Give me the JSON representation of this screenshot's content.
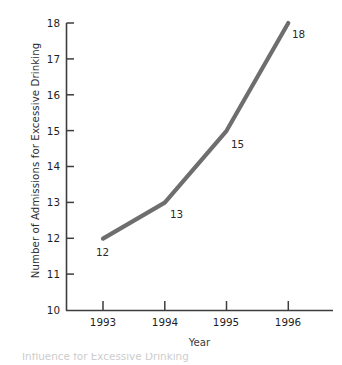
{
  "chart_data": {
    "type": "line",
    "title": "",
    "xlabel": "Year",
    "ylabel": "Number of Admissions for Excessive Drinking",
    "categories": [
      "1993",
      "1994",
      "1995",
      "1996"
    ],
    "x": [
      1993,
      1994,
      1995,
      1996
    ],
    "values": [
      12,
      13,
      15,
      18
    ],
    "point_labels": [
      "12",
      "13",
      "15",
      "18"
    ],
    "xlim": [
      1992.35,
      1996.72
    ],
    "ylim": [
      10,
      18
    ],
    "ytick_labels": [
      "10",
      "11",
      "12",
      "13",
      "14",
      "15",
      "16",
      "17",
      "18"
    ],
    "yticks": [
      10,
      11,
      12,
      13,
      14,
      15,
      16,
      17,
      18
    ],
    "xtick_labels": [
      "1993",
      "1994",
      "1995",
      "1996"
    ],
    "grid": false,
    "legend": false,
    "legend_position": "none",
    "series": [
      {
        "name": "Number of Admissions for Excessive Drinking",
        "values": [
          12,
          13,
          15,
          18
        ],
        "color": "#6e6e6e"
      }
    ]
  },
  "axes": {
    "line_color": "#3d3d3d",
    "tick_color": "#3d3d3d"
  },
  "caption": {
    "text": "Influence for Excessive Drinking",
    "color": "#b9b9b9"
  }
}
